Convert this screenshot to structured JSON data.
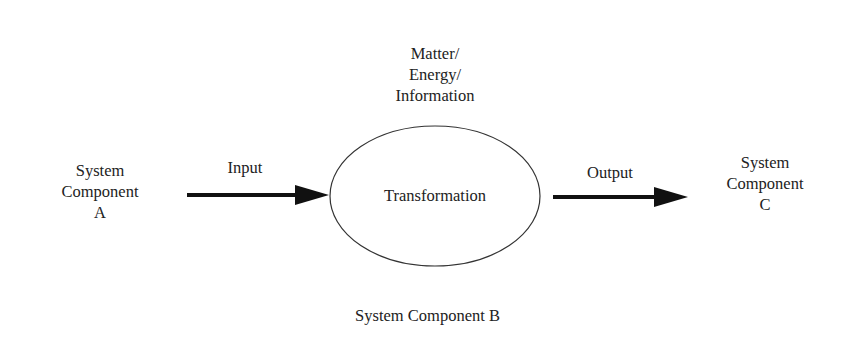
{
  "diagram": {
    "component_a": {
      "line1": "System",
      "line2": "Component",
      "line3": "A"
    },
    "component_b": {
      "label": "System Component B"
    },
    "component_c": {
      "line1": "System",
      "line2": "Component",
      "line3": "C"
    },
    "flow_types": {
      "line1": "Matter/",
      "line2": "Energy/",
      "line3": "Information"
    },
    "process": {
      "label": "Transformation"
    },
    "input_arrow": {
      "label": "Input"
    },
    "output_arrow": {
      "label": "Output"
    },
    "colors": {
      "stroke": "#222222",
      "background": "#ffffff"
    }
  }
}
